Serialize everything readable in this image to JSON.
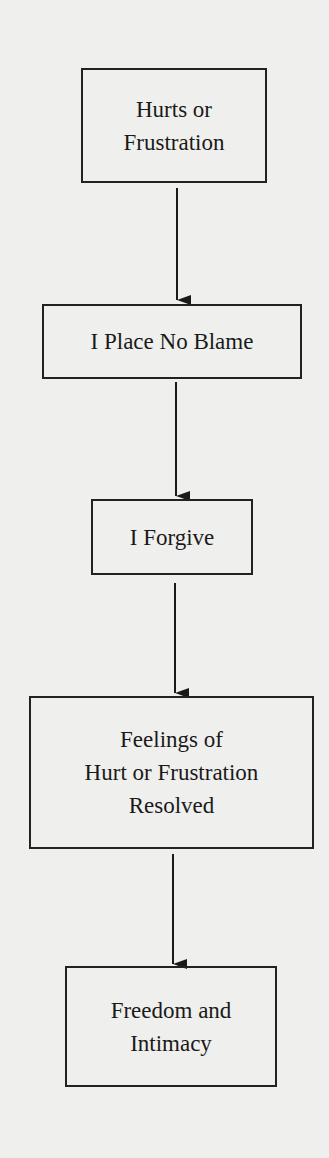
{
  "diagram": {
    "type": "flowchart",
    "direction": "top-to-bottom",
    "nodes": [
      {
        "id": "n1",
        "lines": [
          "Hurts or",
          "Frustration"
        ]
      },
      {
        "id": "n2",
        "lines": [
          "I Place No Blame"
        ]
      },
      {
        "id": "n3",
        "lines": [
          "I Forgive"
        ]
      },
      {
        "id": "n4",
        "lines": [
          "Feelings of",
          "Hurt or Frustration",
          "Resolved"
        ]
      },
      {
        "id": "n5",
        "lines": [
          "Freedom and",
          "Intimacy"
        ]
      }
    ],
    "edges": [
      {
        "from": "n1",
        "to": "n2"
      },
      {
        "from": "n2",
        "to": "n3"
      },
      {
        "from": "n3",
        "to": "n4"
      },
      {
        "from": "n4",
        "to": "n5"
      }
    ]
  }
}
